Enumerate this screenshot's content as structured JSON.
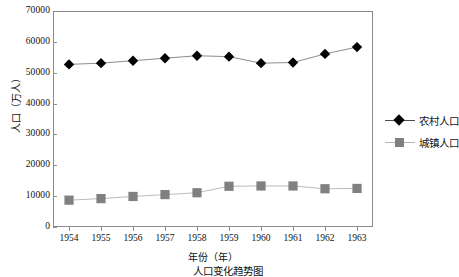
{
  "chart_data": {
    "type": "line",
    "title": "",
    "xlabel": "年份（年）",
    "ylabel": "人口（万人）",
    "categories": [
      "1954",
      "1955",
      "1956",
      "1957",
      "1958",
      "1959",
      "1960",
      "1961",
      "1962",
      "1963"
    ],
    "ylim": [
      0,
      70000
    ],
    "yticks": [
      0,
      10000,
      20000,
      30000,
      40000,
      50000,
      60000,
      70000
    ],
    "ytick_labels": [
      "0",
      "10000",
      "20000",
      "30000",
      "40000",
      "50000",
      "60000",
      "70000"
    ],
    "grid": false,
    "legend_position": "right",
    "series": [
      {
        "name": "农村人口",
        "marker": "diamond",
        "color": "#000000",
        "line_color": "#808080",
        "values": [
          52700,
          53100,
          53900,
          54700,
          55500,
          55200,
          53100,
          53300,
          56100,
          58300
        ]
      },
      {
        "name": "城镇人口",
        "marker": "square",
        "color": "#808080",
        "line_color": "#b3b3b3",
        "values": [
          8700,
          9200,
          9900,
          10500,
          11100,
          13200,
          13300,
          13300,
          12400,
          12500
        ]
      }
    ]
  },
  "legend": {
    "items": [
      {
        "label": "农村人口",
        "key": "diamond-marker"
      },
      {
        "label": "城镇人口",
        "key": "square-marker"
      }
    ]
  },
  "caption": "人口变化趋势图",
  "colors": {
    "frame": "#8c8c8c",
    "rural_marker": "#000000",
    "urban_marker": "#808080",
    "text": "#111111"
  }
}
